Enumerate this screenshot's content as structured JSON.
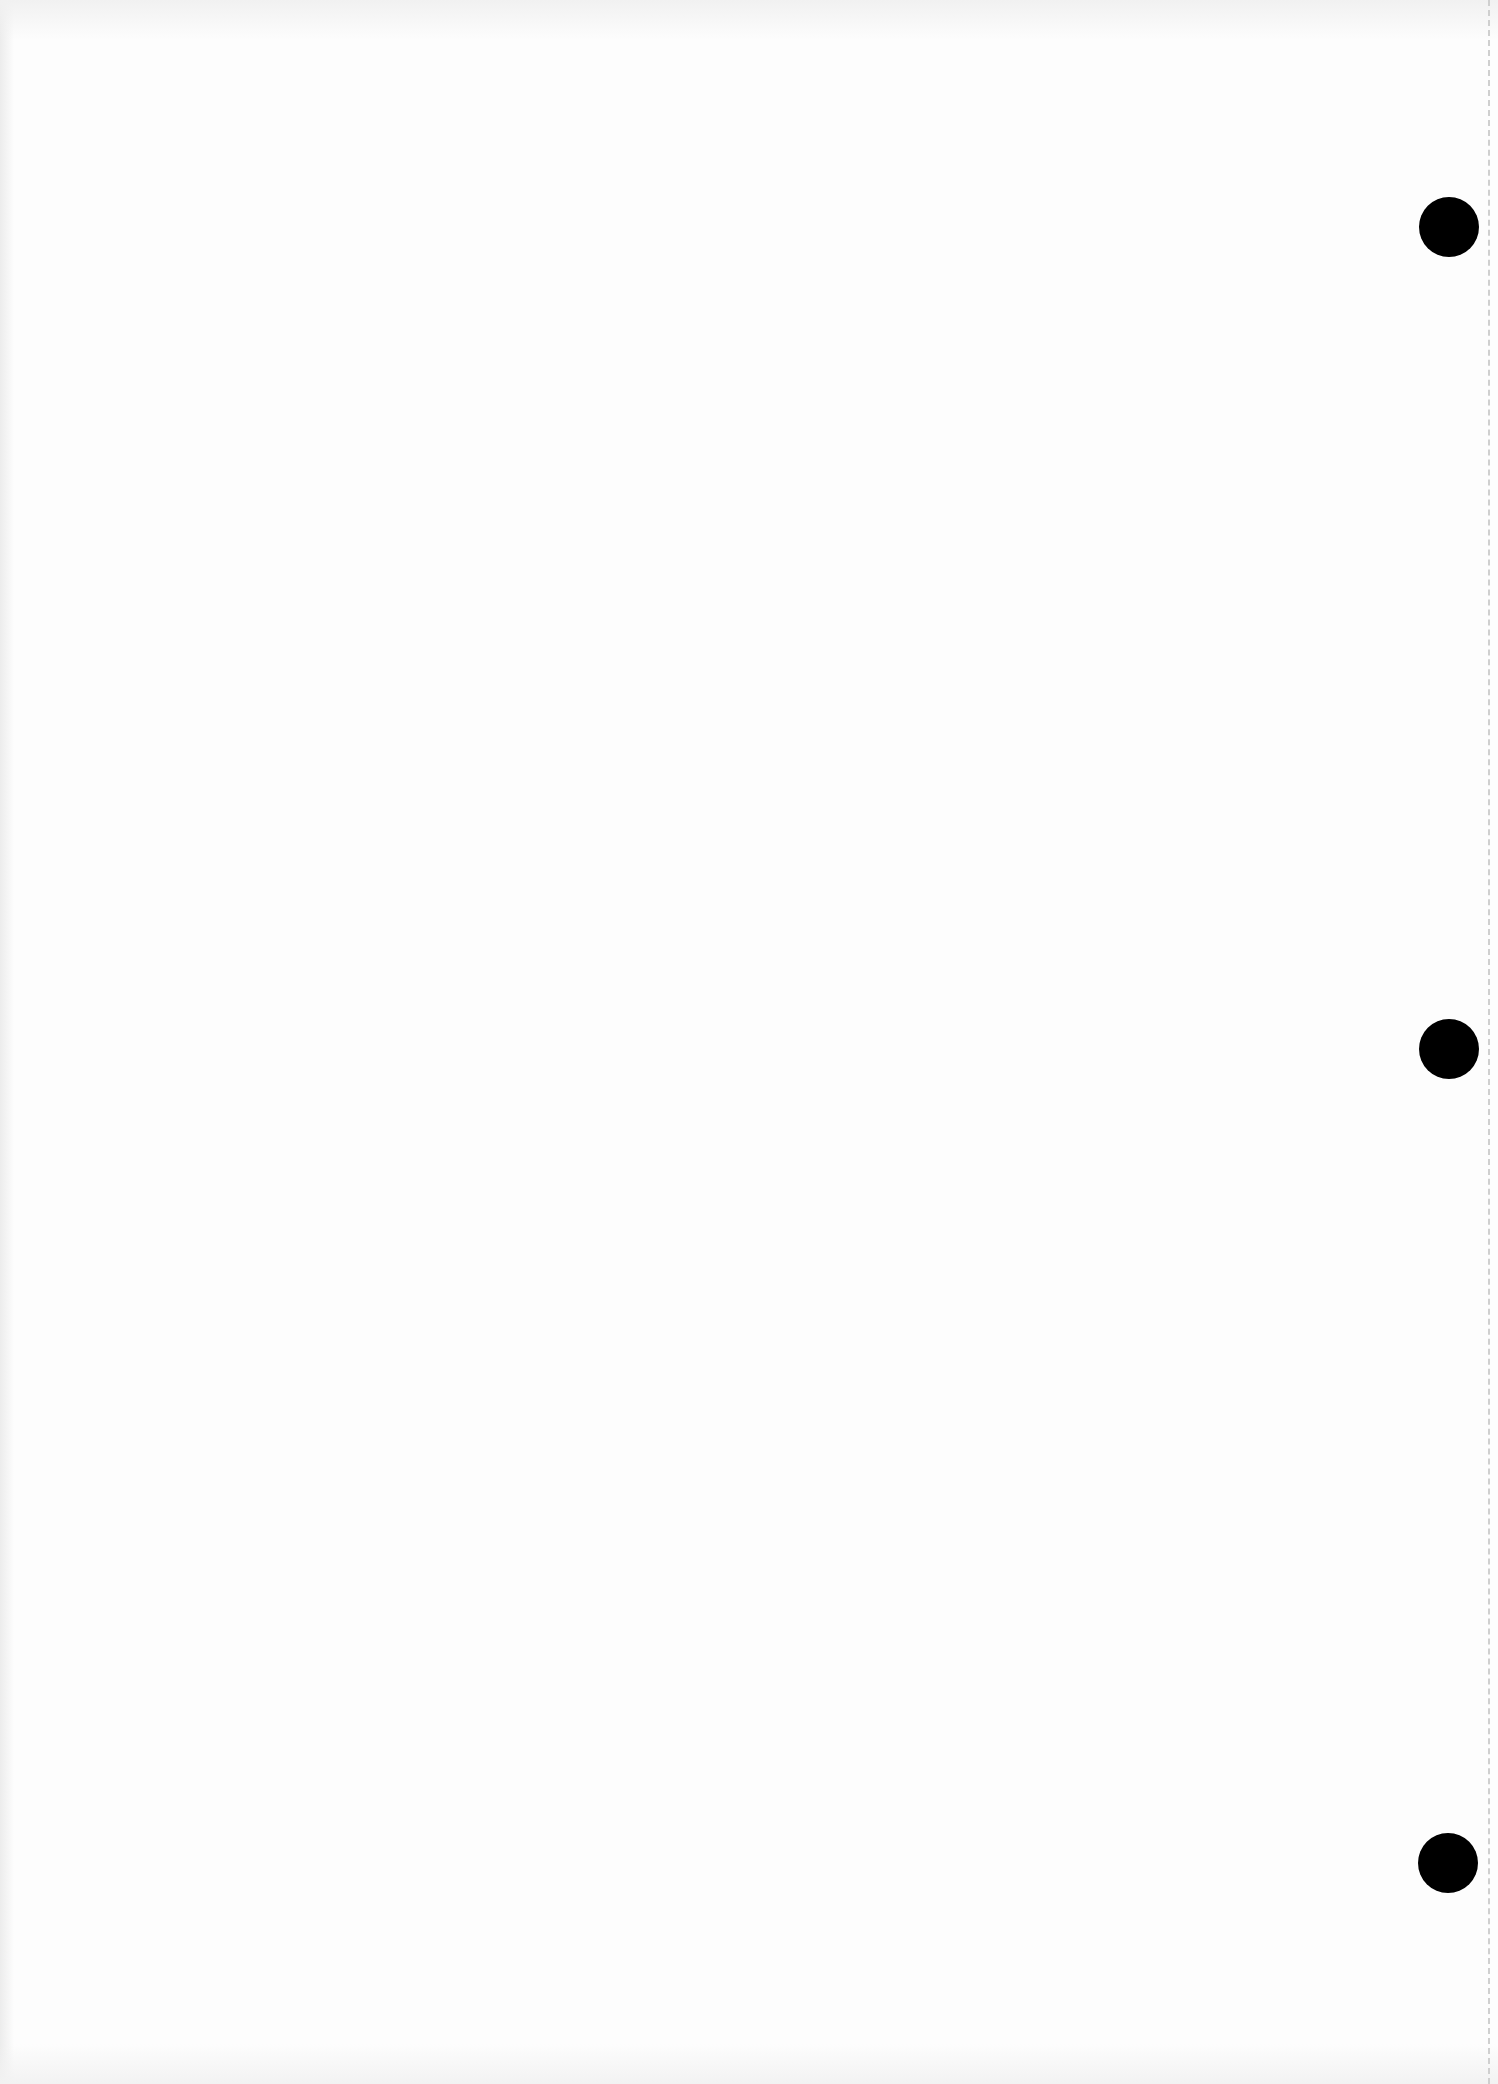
{
  "page": {
    "type": "blank scanned sheet",
    "background_color": "#fdfdfd",
    "bleed_through_text": {
      "top": "",
      "bottom": ""
    }
  },
  "punch_holes": [
    {
      "label": "top-punch-hole",
      "cx": 1449,
      "cy": 227,
      "diameter": 60
    },
    {
      "label": "middle-punch-hole",
      "cx": 1449,
      "cy": 1049,
      "diameter": 60
    },
    {
      "label": "bottom-punch-hole",
      "cx": 1448,
      "cy": 1863,
      "diameter": 60
    }
  ],
  "perforation": {
    "x": 1489,
    "style": "dashed",
    "color": "#cfcfcf"
  },
  "colors": {
    "hole": "#000000",
    "paper": "#fdfdfd"
  }
}
